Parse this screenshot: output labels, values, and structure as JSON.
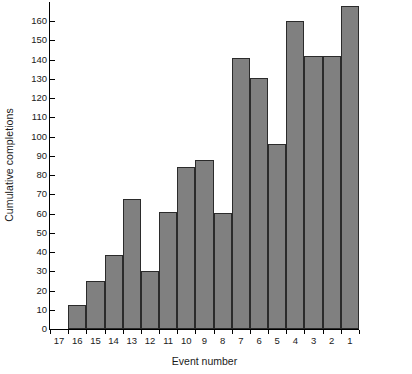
{
  "chart_data": {
    "type": "bar",
    "title": "",
    "xlabel": "Event number",
    "ylabel": "Cumulative completions",
    "categories": [
      "17",
      "16",
      "15",
      "14",
      "13",
      "12",
      "11",
      "10",
      "9",
      "8",
      "7",
      "6",
      "5",
      "4",
      "3",
      "2",
      "1"
    ],
    "values": [
      0,
      12.5,
      25,
      38.5,
      67.5,
      30,
      61,
      84,
      88,
      60.5,
      141,
      130.5,
      96,
      160,
      142,
      142,
      168
    ],
    "ylim": [
      0,
      170
    ],
    "xlim_note": "categorical, contiguous bars, no gaps",
    "yticks": [
      0,
      10,
      20,
      30,
      40,
      50,
      60,
      70,
      80,
      90,
      100,
      110,
      120,
      130,
      140,
      150,
      160
    ],
    "ytick_labels": [
      "0",
      "10",
      "20",
      "30",
      "40",
      "50",
      "60",
      "70",
      "80",
      "90",
      "100",
      "110",
      "120",
      "130",
      "140",
      "150",
      "160"
    ],
    "grid": false,
    "legend": null,
    "bar_color": "#808080",
    "bar_edge_color": "#2b2b2b",
    "axis_color": "#000000",
    "background": "#ffffff"
  }
}
